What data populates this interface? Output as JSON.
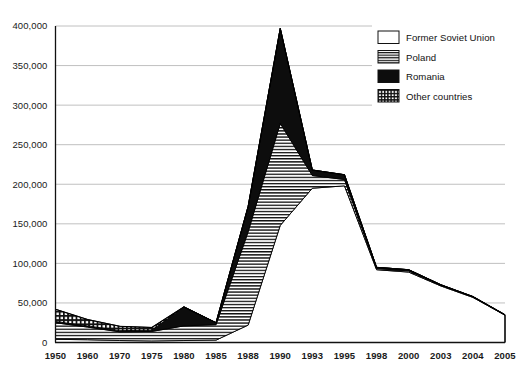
{
  "chart_data": {
    "type": "area",
    "stacked": true,
    "title": "",
    "subtitle": "",
    "xlabel": "",
    "ylabel": "",
    "categories": [
      "1950",
      "1960",
      "1970",
      "1975",
      "1980",
      "1985",
      "1988",
      "1990",
      "1993",
      "1995",
      "1998",
      "2000",
      "2003",
      "2004",
      "2005"
    ],
    "ytick_labels": [
      "0",
      "50,000",
      "100,000",
      "150,000",
      "200,000",
      "250,000",
      "300,000",
      "350,000",
      "400,000"
    ],
    "ytick_values": [
      0,
      50000,
      100000,
      150000,
      200000,
      250000,
      300000,
      350000,
      400000
    ],
    "ylim": [
      0,
      400000
    ],
    "grid": true,
    "grid_axis": "y",
    "legend_position": "top-right",
    "series": [
      {
        "name": "Former Soviet Union",
        "pattern": "solid-white",
        "color": "#ffffff",
        "values": [
          4000,
          3500,
          2500,
          2000,
          2500,
          3000,
          22000,
          148000,
          195000,
          198000,
          92000,
          89000,
          71500,
          57000,
          34500
        ]
      },
      {
        "name": "Poland",
        "pattern": "horizontal-lines",
        "color": "#ffffff",
        "values": [
          21000,
          16000,
          11000,
          12000,
          18500,
          19500,
          118000,
          129000,
          16000,
          8000,
          1500,
          1500,
          1000,
          700,
          400
        ]
      },
      {
        "name": "Romania",
        "pattern": "solid-black",
        "color": "#000000",
        "values": [
          1500,
          1500,
          1500,
          1500,
          24000,
          2500,
          32000,
          120000,
          7000,
          6000,
          1500,
          1500,
          500,
          300,
          100
        ]
      },
      {
        "name": "Other countries",
        "pattern": "grid-checker",
        "color": "#000000",
        "values": [
          15500,
          8000,
          5500,
          3500,
          0,
          0,
          0,
          0,
          0,
          0,
          0,
          0,
          0,
          0,
          0
        ]
      }
    ],
    "stack_totals": [
      42000,
      29000,
      20500,
      19000,
      45000,
      25000,
      172000,
      397000,
      218000,
      212000,
      95000,
      92000,
      73000,
      58000,
      35000
    ]
  },
  "legend": {
    "items": [
      {
        "label": "Former Soviet Union",
        "swatch": "swatch-white"
      },
      {
        "label": "Poland",
        "swatch": "swatch-hlines"
      },
      {
        "label": "Romania",
        "swatch": "swatch-black"
      },
      {
        "label": "Other countries",
        "swatch": "swatch-grid"
      }
    ]
  }
}
